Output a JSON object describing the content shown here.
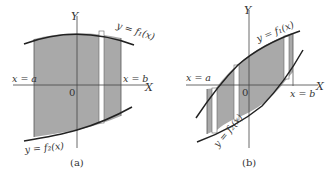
{
  "panels": [
    {
      "id": "a",
      "caption": "(a)",
      "y_axis_label": "Y",
      "x_axis_label": "X",
      "origin_label": "0",
      "left_bound_label": "x = a",
      "right_bound_label": "x = b",
      "upper_curve_label": "y = f₁(x)",
      "lower_curve_label": "y = f₂(x)"
    },
    {
      "id": "b",
      "caption": "(b)",
      "y_axis_label": "Y",
      "x_axis_label": "X",
      "origin_label": "0",
      "left_bound_label": "x = a",
      "right_bound_label": "x = b",
      "upper_curve_label": "y = f₁(x)",
      "lower_curve_label": "y = f₂(x)"
    }
  ],
  "colors": {
    "shade": "#a9a9a9",
    "curve": "#222222",
    "axis": "#444444",
    "strip": "#ffffff"
  }
}
